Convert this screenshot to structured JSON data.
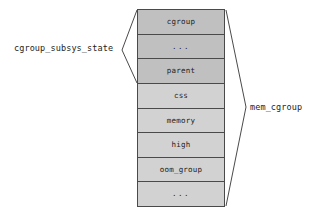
{
  "diagram": {
    "colors": {
      "shade_dark": "#c0c0c0",
      "shade_light": "#d2d2d2",
      "border": "#4a4a4a",
      "text": "#1c1c1c",
      "background": "#ffffff"
    },
    "struct_fields": [
      {
        "label": "cgroup",
        "shade": "dark"
      },
      {
        "label": "...",
        "shade": "dark"
      },
      {
        "label": "parent",
        "shade": "dark"
      },
      {
        "label": "css",
        "shade": "light"
      },
      {
        "label": "memory",
        "shade": "light"
      },
      {
        "label": "high",
        "shade": "light"
      },
      {
        "label": "oom_group",
        "shade": "light"
      },
      {
        "label": "...",
        "shade": "light"
      }
    ],
    "annotations": {
      "left_label": "cgroup_subsys_state",
      "right_label": "mem_cgroup"
    }
  }
}
